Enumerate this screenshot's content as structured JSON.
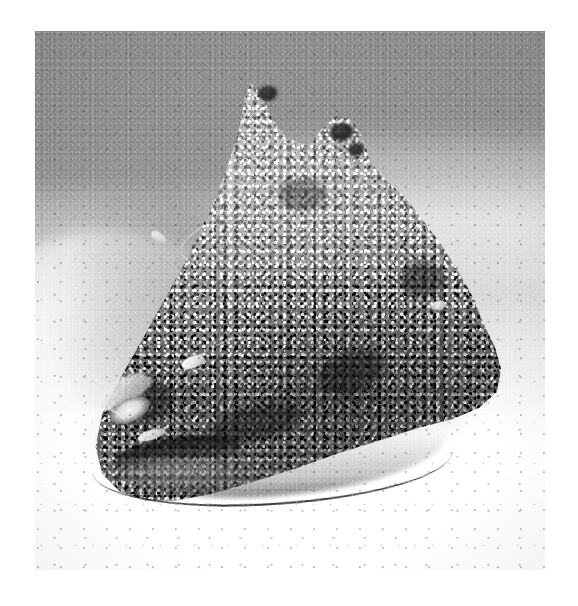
{
  "page": {
    "kind": "photograph",
    "medium": "black-and-white halftone print",
    "width": 578,
    "height": 606,
    "background_color": "#ffffff",
    "margin_color": "#ffffff"
  },
  "photo": {
    "x": 35,
    "y": 31,
    "width": 510,
    "height": 539,
    "orientation": "portrait",
    "caption": "",
    "subject": "Stonefish resting camouflaged on a sandy seabed",
    "palette": {
      "water_upper": "#949494",
      "sand_mid": "#cfcfcf",
      "sand_foreground": "#ffffff",
      "fish_midtone": "#9a9a9a",
      "fish_shadow": "#2a2a2a",
      "fish_highlight": "#e8e8e8"
    }
  },
  "scene": {
    "background": {
      "name": "open water and sand slope",
      "upper_tone": "#949494",
      "lower_tone": "#fdfdfd",
      "ridge_label": "light sand ridge",
      "mound_label": "pale sand mound at left",
      "shadow_label": "cast shadow beside the fish"
    },
    "foreground": {
      "name": "bright white sand",
      "tone": "#ffffff",
      "speckle_tone": "#5a5a5a"
    }
  },
  "subject": {
    "name": "stonefish",
    "pose": "settled on the seabed, facing lower-left",
    "silhouette": "broad triangular hump with a wide flat base",
    "parts": [
      {
        "name": "dorsal-spine-primary",
        "note": "tall pointed hump at the crest"
      },
      {
        "name": "dorsal-spine-secondary",
        "note": "smaller knob to the right of the crest"
      },
      {
        "name": "eye",
        "note": "pale raised eye with dark pupil, upper-left of head"
      },
      {
        "name": "mouth",
        "note": "dark downturned gape below the eye"
      },
      {
        "name": "pectoral-fin",
        "note": "thin dark fin margin meeting the sand"
      },
      {
        "name": "skin",
        "note": "warty, encrusted, heavily mottled camouflage"
      }
    ],
    "texture_keywords": [
      "warty",
      "encrusted",
      "mottled",
      "granular",
      "algae-covered"
    ]
  }
}
